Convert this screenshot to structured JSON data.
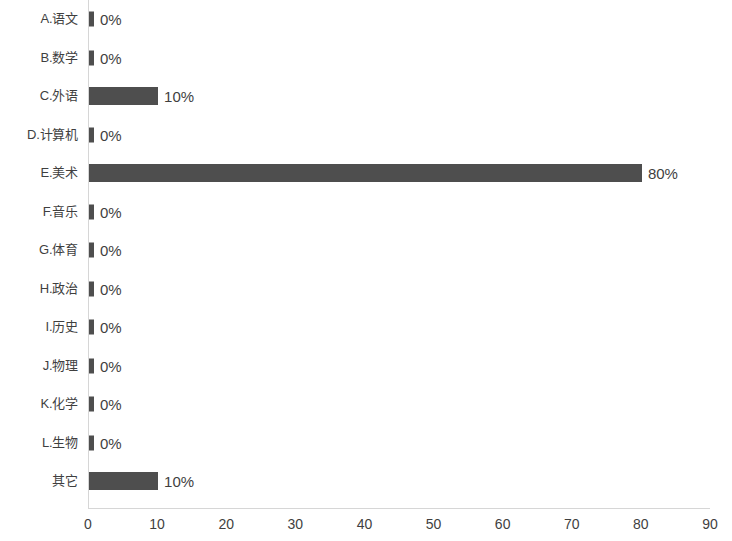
{
  "chart_data": {
    "type": "bar",
    "orientation": "horizontal",
    "title": "",
    "subtitle": "",
    "xlabel": "",
    "ylabel": "",
    "xlim": [
      0,
      90
    ],
    "xticks": [
      0,
      10,
      20,
      30,
      40,
      50,
      60,
      70,
      80,
      90
    ],
    "grid": false,
    "legend": false,
    "bar_color": "#4e4e4e",
    "axis_color": "#d6d6d6",
    "text_color": "#3f3f3f",
    "categories": [
      "A.语文",
      "B.数学",
      "C.外语",
      "D.计算机",
      "E.美术",
      "F.音乐",
      "G.体育",
      "H.政治",
      "I.历史",
      "J.物理",
      "K.化学",
      "L.生物",
      "其它"
    ],
    "values": [
      0,
      0,
      10,
      0,
      80,
      0,
      0,
      0,
      0,
      0,
      0,
      0,
      10
    ],
    "data_labels": [
      "0%",
      "0%",
      "10%",
      "0%",
      "80%",
      "0%",
      "0%",
      "0%",
      "0%",
      "0%",
      "0%",
      "0%",
      "10%"
    ]
  }
}
